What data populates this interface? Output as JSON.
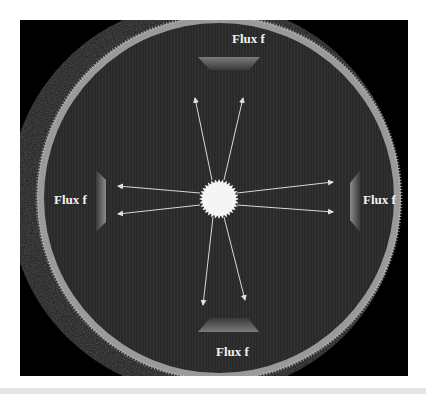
{
  "diagram": {
    "type": "flux-measurement-illustration",
    "labels": {
      "top": "Flux f",
      "left": "Flux f",
      "right": "Flux f",
      "bottom": "Flux f"
    },
    "elements": {
      "source": "central-star",
      "detectors": [
        "top-detector",
        "left-detector",
        "right-detector",
        "bottom-detector"
      ],
      "rays": 8
    },
    "colors": {
      "background": "#000000",
      "sphere_fill": "#2b2b2b",
      "ring": "#b5b5b5",
      "star": "#f5f5f5",
      "arrows": "#d8d8d8",
      "label_text": "#f2f2f2"
    }
  }
}
